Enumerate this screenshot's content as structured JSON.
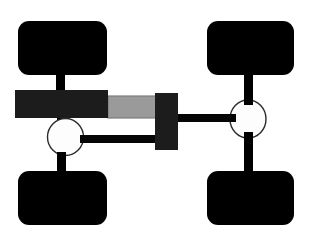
{
  "canvas": {
    "width": 311,
    "height": 239,
    "background_color": "#ffffff",
    "title": "Vehicle steering linkage schematic"
  },
  "palette": {
    "wheel_black": "#000000",
    "beam_charcoal": "#1c1c1c",
    "beam_charcoal_edge": "#2a2a2a",
    "gray_bar_fill": "#9a9a9a",
    "gray_bar_edge": "#7d7d7d",
    "hub_fill": "#fdfdfd",
    "hub_stroke": "#2b2b2b",
    "link_black": "#050505"
  },
  "parts": {
    "wheels": [
      {
        "id": "wheel-front-left",
        "label": "Front left wheel",
        "x": 18,
        "y": 21,
        "width": 89,
        "height": 54,
        "radius": 11,
        "color": "#000000"
      },
      {
        "id": "wheel-front-right",
        "label": "Front right wheel",
        "x": 207,
        "y": 21,
        "width": 87,
        "height": 54,
        "radius": 11,
        "color": "#000000"
      },
      {
        "id": "wheel-rear-left",
        "label": "Rear left wheel",
        "x": 18,
        "y": 171,
        "width": 89,
        "height": 54,
        "radius": 11,
        "color": "#000000"
      },
      {
        "id": "wheel-rear-right",
        "label": "Rear right wheel",
        "x": 207,
        "y": 171,
        "width": 87,
        "height": 54,
        "radius": 11,
        "color": "#000000"
      }
    ],
    "hubs": [
      {
        "id": "hub-left",
        "label": "Left steering knuckle hub",
        "cx": 65.5,
        "cy": 137,
        "rx": 18,
        "ry": 18.5,
        "fill": "#fdfdfd",
        "stroke": "#2b2b2b",
        "stroke_width": 1.4
      },
      {
        "id": "hub-right",
        "label": "Right steering knuckle hub",
        "cx": 248,
        "cy": 119,
        "rx": 18,
        "ry": 19,
        "fill": "#fdfdfd",
        "stroke": "#2b2b2b",
        "stroke_width": 1.4
      }
    ],
    "beams": [
      {
        "id": "main-beam",
        "label": "Main transverse beam",
        "x": 15,
        "y": 90,
        "width": 93,
        "height": 28,
        "fill": "#1c1c1c"
      },
      {
        "id": "upright-block",
        "label": "Right vertical pivot block",
        "x": 155,
        "y": 93,
        "width": 23,
        "height": 57,
        "fill": "#1c1c1c"
      }
    ],
    "gray_bar": {
      "id": "gray-slider-bar",
      "label": "Gray sliding rack bar",
      "x": 108,
      "y": 96,
      "width": 52,
      "height": 22,
      "fill": "#9a9a9a",
      "stroke": "#7d7d7d"
    },
    "links": [
      {
        "id": "stem-front-left",
        "label": "Front left wheel stem",
        "x": 56,
        "y": 74,
        "width": 9,
        "height": 17,
        "fill": "#000000"
      },
      {
        "id": "stem-front-right",
        "label": "Front right wheel stem",
        "x": 244,
        "y": 74,
        "width": 9,
        "height": 27,
        "fill": "#000000"
      },
      {
        "id": "stem-rear-left",
        "label": "Rear left wheel stem",
        "x": 57,
        "y": 153,
        "width": 9,
        "height": 19,
        "fill": "#000000"
      },
      {
        "id": "stem-rear-right",
        "label": "Rear right wheel stem",
        "x": 244,
        "y": 136,
        "width": 9,
        "height": 36,
        "fill": "#000000"
      },
      {
        "id": "stem-hub-left-top",
        "label": "Left hub upper stem",
        "x": 57,
        "y": 113,
        "width": 9,
        "height": 9,
        "fill": "#000000"
      },
      {
        "id": "tie-rod-lower",
        "label": "Lower tie rod",
        "x": 78,
        "y": 135,
        "width": 99,
        "height": 8,
        "fill": "#050505"
      },
      {
        "id": "drag-link-right",
        "label": "Right drag link",
        "x": 172,
        "y": 114,
        "width": 62,
        "height": 8,
        "fill": "#050505"
      }
    ]
  },
  "legend": {
    "component_names": [
      "Front left wheel",
      "Front right wheel",
      "Rear left wheel",
      "Rear right wheel",
      "Main transverse beam",
      "Gray sliding rack bar",
      "Right vertical pivot block",
      "Left steering knuckle hub",
      "Right steering knuckle hub",
      "Lower tie rod",
      "Right drag link"
    ]
  }
}
